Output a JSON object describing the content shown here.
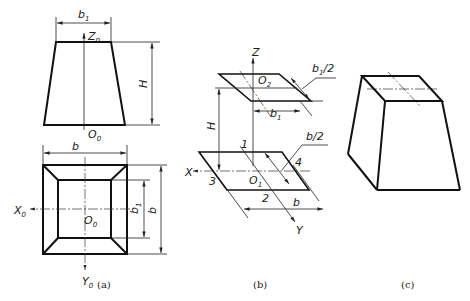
{
  "figure": {
    "panels": [
      {
        "id": "a",
        "caption": "(a)",
        "description": "Orthographic views of square frustum: front view (trapezoid) and top view (square with inner square)",
        "labels": {
          "top_width": "b",
          "top_width_sub": "1",
          "axis_z": "Z",
          "axis_z_sub": "0",
          "height": "H",
          "origin_front": "O",
          "origin_front_sub": "0",
          "bottom_width": "b",
          "axis_x": "X",
          "axis_x_sub": "0",
          "origin_top": "O",
          "origin_top_sub": "0",
          "inner_side": "b",
          "inner_side_sub": "1",
          "outer_side": "b",
          "axis_y": "Y",
          "axis_y_sub": "0"
        }
      },
      {
        "id": "b",
        "caption": "(b)",
        "description": "Oblique axonometric construction of top and bottom squares",
        "labels": {
          "axis_z": "Z",
          "origin_top": "O",
          "origin_top_sub": "2",
          "half_top": "b",
          "half_top_sub": "1",
          "half_top_suffix": "/2",
          "top_width": "b",
          "top_width_sub": "1",
          "height": "H",
          "half_bottom": "b/2",
          "point_1": "1",
          "point_2": "2",
          "point_3": "3",
          "point_4": "4",
          "axis_x": "X",
          "origin_bottom": "O",
          "origin_bottom_sub": "1",
          "bottom_width": "b",
          "axis_y": "Y"
        }
      },
      {
        "id": "c",
        "caption": "(c)",
        "description": "Completed oblique drawing of square frustum"
      }
    ]
  }
}
